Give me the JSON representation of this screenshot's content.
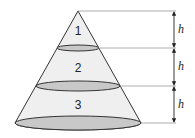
{
  "diagram": {
    "type": "cone-sections",
    "sections": [
      {
        "label": "1"
      },
      {
        "label": "2"
      },
      {
        "label": "3"
      }
    ],
    "dimensions": [
      {
        "label": "h"
      },
      {
        "label": "h"
      },
      {
        "label": "h"
      }
    ],
    "colors": {
      "cone_fill": "#efefef",
      "ellipse_fill": "#c8c8c8",
      "stroke": "#333333",
      "guide": "#888888"
    }
  }
}
